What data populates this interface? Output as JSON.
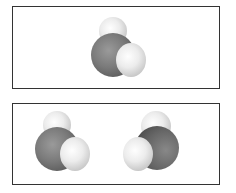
{
  "figure": {
    "panels": [
      {
        "id": "top",
        "molecules": [
          {
            "name": "molecule-1",
            "central_atom_color": "#777777",
            "attached_atom_color": "#eeeeee",
            "attached_atoms": 2,
            "orientation": "H-top, H-right-front"
          }
        ]
      },
      {
        "id": "bottom",
        "molecules": [
          {
            "name": "molecule-2",
            "central_atom_color": "#777777",
            "attached_atom_color": "#eeeeee",
            "attached_atoms": 2,
            "orientation": "H-top, H-right-front"
          },
          {
            "name": "molecule-3",
            "central_atom_color": "#777777",
            "attached_atom_color": "#eeeeee",
            "attached_atoms": 2,
            "orientation": "H-top, H-left-front"
          }
        ]
      }
    ],
    "colors": {
      "border": "#333333",
      "background": "#ffffff"
    }
  }
}
